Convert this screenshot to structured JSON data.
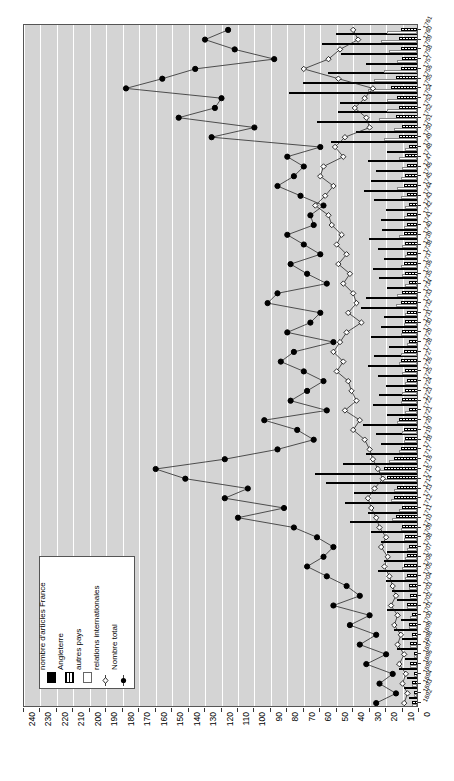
{
  "chart_data": {
    "type": "bar",
    "title": "",
    "subtitle": "",
    "xlabel": "",
    "ylabel": "",
    "orientation": "horizontal",
    "x_axis_reversed": true,
    "xlim": [
      0,
      240
    ],
    "xticks": [
      240,
      230,
      220,
      210,
      200,
      190,
      180,
      170,
      160,
      150,
      140,
      130,
      120,
      110,
      100,
      90,
      80,
      70,
      60,
      50,
      40,
      30,
      20,
      10,
      0
    ],
    "grid": "vertical-white",
    "legend_position": "bottom-left",
    "legend": [
      {
        "label": "nombre d'articles  France",
        "symbol": "solid-black-bar",
        "color": "#000000"
      },
      {
        "label": "Angleterre",
        "symbol": "hatched-bar",
        "color": "#000000"
      },
      {
        "label": "autres pays",
        "symbol": "white-bar",
        "color": "#ffffff"
      },
      {
        "label": "relations internationales",
        "symbol": "open-diamond-line",
        "color": "#000000"
      },
      {
        "label": "Nombre total",
        "symbol": "filled-circle-line",
        "color": "#000000"
      }
    ],
    "categories": [
      "1761",
      "1760",
      "1759",
      "1758",
      "1757",
      "1756",
      "1755",
      "1754",
      "1753",
      "1752",
      "1751",
      "1750",
      "1749",
      "1748",
      "1747",
      "1746",
      "1745",
      "1744",
      "1743",
      "1742",
      "1741",
      "1740",
      "1739",
      "1738",
      "1737",
      "1736",
      "1735",
      "1734",
      "1733",
      "1732",
      "1731",
      "1730",
      "1729",
      "1728",
      "1727",
      "1726",
      "1725",
      "1724",
      "1723",
      "1722",
      "1721",
      "1720",
      "1719",
      "1718",
      "1717",
      "1716",
      "1715",
      "1714",
      "1713",
      "1712",
      "1711",
      "1710",
      "1709",
      "1708",
      "1707",
      "1706",
      "1705",
      "1704",
      "1703",
      "1702",
      "1701",
      "1700",
      "1699",
      "1698",
      "1697",
      "1696",
      "1695",
      "1694",
      "1693",
      "1692"
    ],
    "series": [
      {
        "name": "nombre d'articles  France",
        "type": "bar",
        "values": [
          49,
          58,
          46,
          31,
          54,
          69,
          78,
          47,
          48,
          61,
          37,
          52,
          18,
          30,
          25,
          28,
          32,
          26,
          19,
          22,
          21,
          29,
          24,
          20,
          27,
          23,
          18,
          31,
          34,
          20,
          22,
          28,
          17,
          26,
          30,
          24,
          19,
          23,
          27,
          18,
          33,
          25,
          22,
          31,
          45,
          62,
          55,
          38,
          44,
          30,
          41,
          28,
          22,
          18,
          20,
          24,
          19,
          15,
          12,
          18,
          10,
          14,
          9,
          12,
          7,
          11,
          6,
          8,
          5,
          9
        ]
      },
      {
        "name": "Angleterre",
        "type": "bar",
        "values": [
          10,
          11,
          10,
          9,
          10,
          13,
          16,
          12,
          11,
          13,
          9,
          11,
          5,
          7,
          6,
          7,
          8,
          6,
          5,
          6,
          6,
          8,
          7,
          6,
          8,
          7,
          5,
          9,
          10,
          6,
          7,
          9,
          5,
          8,
          10,
          7,
          6,
          7,
          9,
          5,
          11,
          8,
          7,
          10,
          14,
          20,
          18,
          12,
          14,
          9,
          13,
          9,
          7,
          5,
          6,
          8,
          6,
          5,
          4,
          6,
          3,
          5,
          3,
          4,
          2,
          4,
          2,
          3,
          2,
          3
        ]
      },
      {
        "name": "autres pays",
        "type": "bar",
        "values": [
          18,
          22,
          17,
          12,
          20,
          26,
          30,
          18,
          18,
          23,
          14,
          20,
          7,
          11,
          9,
          10,
          12,
          10,
          7,
          8,
          8,
          11,
          9,
          7,
          10,
          9,
          7,
          12,
          13,
          7,
          8,
          10,
          6,
          10,
          11,
          9,
          7,
          9,
          10,
          7,
          12,
          9,
          8,
          11,
          17,
          23,
          21,
          14,
          16,
          11,
          15,
          10,
          8,
          6,
          7,
          9,
          7,
          5,
          4,
          6,
          4,
          5,
          3,
          4,
          2,
          4,
          2,
          3,
          2,
          3
        ]
      },
      {
        "name": "relations internationales",
        "type": "line",
        "marker": "open-diamond",
        "values": [
          40,
          37,
          48,
          55,
          70,
          49,
          28,
          33,
          39,
          32,
          30,
          45,
          51,
          46,
          58,
          60,
          52,
          57,
          63,
          55,
          53,
          47,
          50,
          44,
          49,
          42,
          46,
          40,
          38,
          43,
          35,
          44,
          48,
          52,
          46,
          50,
          43,
          41,
          38,
          45,
          36,
          40,
          33,
          30,
          28,
          25,
          22,
          27,
          31,
          29,
          26,
          24,
          20,
          23,
          19,
          21,
          18,
          16,
          14,
          17,
          13,
          15,
          11,
          13,
          9,
          12,
          8,
          10,
          7,
          9
        ]
      },
      {
        "name": "Nombre total",
        "type": "line",
        "marker": "filled-circle",
        "values": [
          116,
          130,
          112,
          88,
          136,
          156,
          178,
          120,
          124,
          146,
          100,
          126,
          60,
          80,
          70,
          76,
          86,
          72,
          58,
          66,
          64,
          80,
          70,
          60,
          78,
          68,
          56,
          86,
          92,
          60,
          66,
          80,
          52,
          76,
          84,
          70,
          58,
          68,
          78,
          56,
          94,
          74,
          64,
          86,
          118,
          160,
          142,
          104,
          118,
          82,
          110,
          76,
          62,
          52,
          58,
          68,
          56,
          44,
          36,
          52,
          30,
          42,
          26,
          36,
          20,
          32,
          16,
          24,
          14,
          26
        ]
      }
    ]
  },
  "legend_box": {
    "items": [
      {
        "label": "nombre d'articles  France"
      },
      {
        "label": "Angleterre"
      },
      {
        "label": "autres pays"
      },
      {
        "label": "relations internationales"
      },
      {
        "label": "Nombre total"
      }
    ]
  }
}
